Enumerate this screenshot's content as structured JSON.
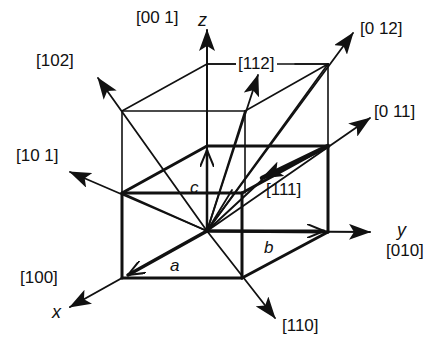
{
  "diagram": {
    "axes": [
      {
        "name": "x",
        "direction": "[100]"
      },
      {
        "name": "y",
        "direction": "[010]"
      },
      {
        "name": "z",
        "direction": "[001]"
      }
    ],
    "vectors": [
      {
        "name": "a",
        "label": "a"
      },
      {
        "name": "b",
        "label": "b"
      },
      {
        "name": "c",
        "label": "c"
      }
    ],
    "directions": [
      "[001]",
      "[102]",
      "[112]",
      "[012]",
      "[011]",
      "[101]",
      "[111]",
      "[010]",
      "[100]",
      "[110]"
    ]
  },
  "labels": {
    "d001": "[00 1]",
    "z": "z",
    "d102": "[102]",
    "d112": "[112]",
    "d012": "[0 12]",
    "d011": "[0 11]",
    "d101": "[10 1]",
    "d111": "[111]",
    "y": "y",
    "d010": "[010]",
    "d100": "[100]",
    "x": "x",
    "d110": "[110]",
    "a": "a",
    "b": "b",
    "c": "c"
  },
  "colors": {
    "ink": "#111111",
    "background": "#ffffff"
  }
}
